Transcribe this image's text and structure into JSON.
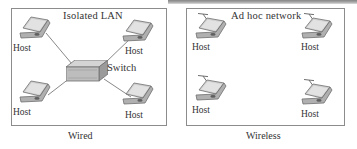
{
  "figure": {
    "panels": [
      {
        "id": "wired",
        "heading": "Isolated LAN",
        "caption": "Wired",
        "center_device": {
          "label": "Switch",
          "icon": "switch-3d-box"
        },
        "nodes": [
          {
            "label": "Host",
            "icon": "laptop-icon",
            "position": "top-left"
          },
          {
            "label": "Host",
            "icon": "laptop-icon",
            "position": "top-right"
          },
          {
            "label": "Host",
            "icon": "laptop-icon",
            "position": "bottom-left"
          },
          {
            "label": "Host",
            "icon": "laptop-icon",
            "position": "bottom-right"
          }
        ],
        "links": 4,
        "topology": "star"
      },
      {
        "id": "wireless",
        "heading": "Ad hoc network",
        "caption": "Wireless",
        "center_device": null,
        "nodes": [
          {
            "label": "Host",
            "icon": "laptop-antenna-icon",
            "position": "top-left"
          },
          {
            "label": "Host",
            "icon": "laptop-antenna-icon",
            "position": "top-right"
          },
          {
            "label": "Host",
            "icon": "laptop-antenna-icon",
            "position": "bottom-left"
          },
          {
            "label": "Host",
            "icon": "laptop-antenna-icon",
            "position": "bottom-right"
          }
        ],
        "links": 0,
        "topology": "mesh-implicit"
      }
    ],
    "colors": {
      "border": "#8c8c8c",
      "text": "#333333",
      "link_line": "#7a7a7a",
      "device_fill_light": "#dcdcdc",
      "device_fill_mid": "#b4b4b4",
      "device_fill_dark": "#8f8f8f",
      "background": "#ffffff"
    }
  }
}
